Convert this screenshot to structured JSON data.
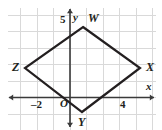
{
  "figure": {
    "type": "geometry-coordinate-plane",
    "width_px": 162,
    "height_px": 130,
    "background_color": "#ffffff",
    "grid": {
      "visible": true,
      "color": "#d9d9d9",
      "spacing_px": 16.5,
      "origin_px": {
        "x": 70,
        "y": 97.5
      },
      "left_px": 8,
      "top_px": 8,
      "right_px": 155.5,
      "bottom_px": 130
    },
    "axes": {
      "color": "#3a3a3a",
      "x_axis": {
        "label": "x",
        "label_pos_px": {
          "x": 146,
          "y": 81
        },
        "y_px": 97.5,
        "arrow_left": true,
        "arrow_right": true
      },
      "y_axis": {
        "label": "y",
        "label_pos_px": {
          "x": 73,
          "y": 12
        },
        "x_px": 70,
        "arrow_up": true,
        "arrow_down": true
      },
      "origin_label": "O",
      "origin_label_pos_px": {
        "x": 60,
        "y": 98
      }
    },
    "tick_labels": [
      {
        "name": "x-tick-negative-2",
        "text": "–2",
        "x_px": 31,
        "y_px": 99,
        "axis": "x",
        "value": -2
      },
      {
        "name": "x-tick-4",
        "text": "4",
        "x_px": 120,
        "y_px": 99,
        "axis": "x",
        "value": 4
      },
      {
        "name": "y-tick-5",
        "text": "5",
        "x_px": 60,
        "y_px": 14,
        "axis": "y",
        "value": 5
      }
    ],
    "shape": {
      "name": "rhombus-WXYZ",
      "stroke_color": "#231f20",
      "stroke_width_px": 2.2,
      "fill": "none",
      "closed": true,
      "vertices": [
        {
          "label": "W",
          "px": {
            "x": 83,
            "y": 27
          },
          "graph": {
            "x": 0.8,
            "y": 4.3
          },
          "label_px": {
            "x": 88,
            "y": 12
          }
        },
        {
          "label": "X",
          "px": {
            "x": 140,
            "y": 68
          },
          "graph": {
            "x": 4.2,
            "y": 1.8
          },
          "label_px": {
            "x": 146,
            "y": 61
          }
        },
        {
          "label": "Y",
          "px": {
            "x": 82,
            "y": 112
          },
          "graph": {
            "x": 0.7,
            "y": -0.9
          },
          "label_px": {
            "x": 78,
            "y": 116
          }
        },
        {
          "label": "Z",
          "px": {
            "x": 25,
            "y": 68
          },
          "graph": {
            "x": -2.7,
            "y": 1.8
          },
          "label_px": {
            "x": 12,
            "y": 61
          }
        }
      ]
    }
  }
}
